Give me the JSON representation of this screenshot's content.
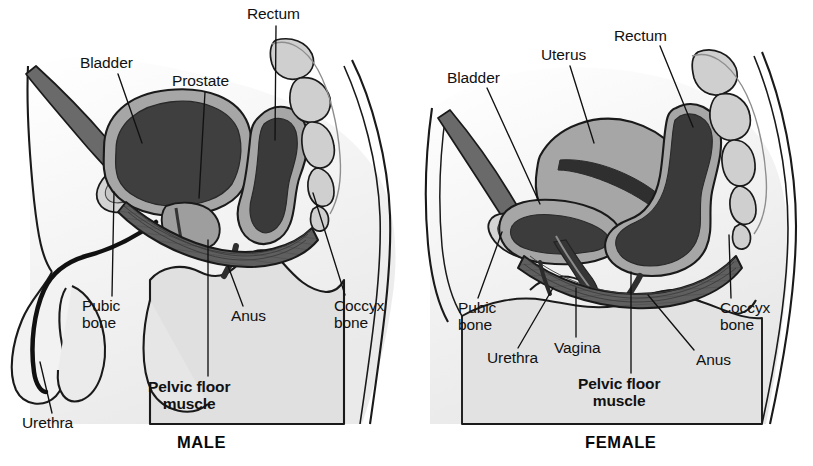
{
  "figure": {
    "title_male": "MALE",
    "title_female": "FEMALE"
  },
  "colors": {
    "background": "#ffffff",
    "outline": "#1a1a1a",
    "body_fill": "#e3e3e3",
    "body_fill_light": "#efefef",
    "organ_mid": "#a8a8a8",
    "organ_dark": "#4b4b4b",
    "organ_darkest": "#3a3a3a",
    "muscle": "#5a5a5a",
    "bone": "#cccccc",
    "leader_line": "#111111",
    "text": "#111111"
  },
  "male": {
    "caption": "MALE",
    "labels": [
      {
        "id": "bladder",
        "text": "Bladder",
        "x": 80,
        "y": 55,
        "align": "left"
      },
      {
        "id": "prostate",
        "text": "Prostate",
        "x": 172,
        "y": 73,
        "align": "left"
      },
      {
        "id": "rectum",
        "text": "Rectum",
        "x": 247,
        "y": 6,
        "align": "left"
      },
      {
        "id": "pubic-bone",
        "text": "Pubic\nbone",
        "x": 82,
        "y": 298,
        "align": "left"
      },
      {
        "id": "anus",
        "text": "Anus",
        "x": 231,
        "y": 308,
        "align": "left"
      },
      {
        "id": "coccyx-bone",
        "text": "Coccyx\nbone",
        "x": 334,
        "y": 298,
        "align": "left"
      },
      {
        "id": "pelvic-floor",
        "text": "Pelvic floor\nmuscle",
        "x": 148,
        "y": 379,
        "align": "left",
        "bold": true
      },
      {
        "id": "urethra",
        "text": "Urethra",
        "x": 22,
        "y": 415,
        "align": "left"
      }
    ],
    "leaders": [
      {
        "id": "bladder",
        "from": [
          118,
          74
        ],
        "to": [
          142,
          143
        ]
      },
      {
        "id": "prostate",
        "from": [
          205,
          92
        ],
        "to": [
          199,
          198
        ]
      },
      {
        "id": "rectum",
        "from": [
          276,
          26
        ],
        "to": [
          275,
          140
        ]
      },
      {
        "id": "pubic-bone",
        "from": [
          112,
          296
        ],
        "to": [
          114,
          192
        ]
      },
      {
        "id": "anus",
        "from": [
          243,
          306
        ],
        "to": [
          228,
          266
        ]
      },
      {
        "id": "coccyx-bone",
        "from": [
          345,
          295
        ],
        "to": [
          313,
          193
        ]
      },
      {
        "id": "pelvic-floor",
        "from": [
          208,
          376
        ],
        "to": [
          208,
          240
        ]
      },
      {
        "id": "urethra",
        "from": [
          52,
          413
        ],
        "to": [
          40,
          362
        ]
      }
    ]
  },
  "female": {
    "caption": "FEMALE",
    "labels": [
      {
        "id": "bladder",
        "text": "Bladder",
        "x": 447,
        "y": 70,
        "align": "left"
      },
      {
        "id": "uterus",
        "text": "Uterus",
        "x": 541,
        "y": 47,
        "align": "left"
      },
      {
        "id": "rectum",
        "text": "Rectum",
        "x": 614,
        "y": 28,
        "align": "left"
      },
      {
        "id": "pubic-bone",
        "text": "Pubic\nbone",
        "x": 458,
        "y": 300,
        "align": "left"
      },
      {
        "id": "urethra",
        "text": "Urethra",
        "x": 487,
        "y": 350,
        "align": "left"
      },
      {
        "id": "vagina",
        "text": "Vagina",
        "x": 554,
        "y": 340,
        "align": "left"
      },
      {
        "id": "anus",
        "text": "Anus",
        "x": 696,
        "y": 352,
        "align": "left"
      },
      {
        "id": "coccyx-bone",
        "text": "Coccyx\nbone",
        "x": 720,
        "y": 300,
        "align": "left"
      },
      {
        "id": "pelvic-floor",
        "text": "Pelvic floor\nmuscle",
        "x": 578,
        "y": 376,
        "align": "left",
        "bold": true
      }
    ],
    "leaders": [
      {
        "id": "bladder",
        "from": [
          487,
          88
        ],
        "to": [
          540,
          204
        ]
      },
      {
        "id": "uterus",
        "from": [
          570,
          66
        ],
        "to": [
          594,
          143
        ]
      },
      {
        "id": "rectum",
        "from": [
          660,
          46
        ],
        "to": [
          693,
          127
        ]
      },
      {
        "id": "pubic-bone",
        "from": [
          478,
          298
        ],
        "to": [
          502,
          232
        ]
      },
      {
        "id": "urethra",
        "from": [
          518,
          348
        ],
        "to": [
          553,
          288
        ]
      },
      {
        "id": "vagina",
        "from": [
          576,
          337
        ],
        "to": [
          576,
          288
        ]
      },
      {
        "id": "anus",
        "from": [
          694,
          350
        ],
        "to": [
          648,
          295
        ]
      },
      {
        "id": "coccyx-bone",
        "from": [
          731,
          298
        ],
        "to": [
          729,
          235
        ]
      },
      {
        "id": "pelvic-floor",
        "from": [
          631,
          373
        ],
        "to": [
          631,
          272
        ]
      }
    ]
  }
}
